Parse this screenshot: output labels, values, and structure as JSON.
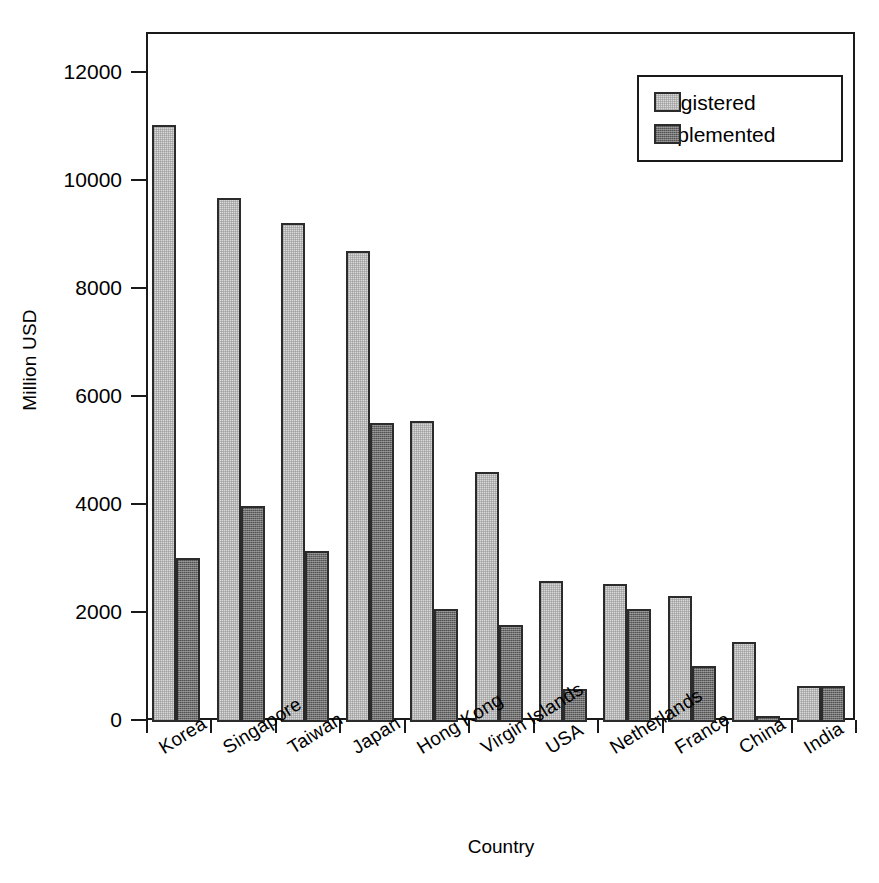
{
  "chart_data": {
    "type": "bar",
    "title": "",
    "xlabel": "Country",
    "ylabel": "Million USD",
    "ylim": [
      0,
      12000
    ],
    "yticks": [
      0,
      2000,
      4000,
      6000,
      8000,
      10000,
      12000
    ],
    "ytick_labels": [
      "0",
      "2000",
      "4000",
      "6000",
      "8000",
      "10000",
      "12000"
    ],
    "grid": false,
    "legend_position": "top-right",
    "categories": [
      "Korea",
      "Singapore",
      "Taiwan",
      "Japan",
      "Hong Kong",
      "Virgin Islands",
      "USA",
      "Netherlands",
      "France",
      "China",
      "India"
    ],
    "series": [
      {
        "name": "Registered",
        "color": "#dadada",
        "values": [
          11050,
          9700,
          9240,
          8720,
          5570,
          4630,
          2610,
          2560,
          2340,
          1490,
          670
        ]
      },
      {
        "name": "Implemented",
        "color": "#6f6f6f",
        "values": [
          3040,
          4000,
          3160,
          5540,
          2090,
          1790,
          620,
          2090,
          1030,
          120,
          660
        ]
      }
    ]
  },
  "legend": {
    "entries": [
      {
        "label": "Registered"
      },
      {
        "label": "Implemented"
      }
    ]
  },
  "colors": {
    "registered": "#dadada",
    "implemented": "#6f6f6f",
    "axis": "#1a1a1a",
    "background": "#ffffff"
  }
}
